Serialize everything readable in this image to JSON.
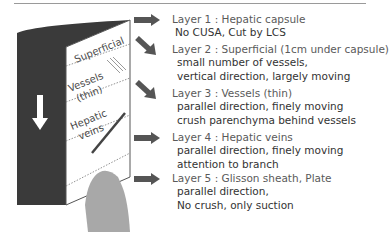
{
  "diagram": {
    "block_labels": [
      "Superficial",
      "Vessels",
      "(thin)",
      "Hepatic",
      "veins"
    ],
    "colors": {
      "dark_face": "#3a3a3a",
      "arrow": "#555555",
      "gray_shape": "#a8a8a8",
      "title_text": "#5a5a5a"
    },
    "arrow_icon": "down-arrow"
  },
  "layers": [
    {
      "title": "Layer 1 : Hepatic capsule",
      "lines": [
        "No CUSA, Cut by LCS"
      ],
      "arrow": "right"
    },
    {
      "title": "Layer 2 : Superficial (1cm under capsule)",
      "lines": [
        "small number of vessels,",
        "vertical direction, largely moving"
      ],
      "arrow": "down-right"
    },
    {
      "title": "Layer 3 : Vessels (thin)",
      "lines": [
        "parallel direction, finely moving",
        "crush parenchyma behind vessels"
      ],
      "arrow": "down-right"
    },
    {
      "title": "Layer 4 : Hepatic veins",
      "lines": [
        "parallel direction, finely moving",
        "attention to branch"
      ],
      "arrow": "right"
    },
    {
      "title": "Layer 5 : Glisson sheath, Plate",
      "lines": [
        "parallel direction,",
        "No crush, only suction"
      ],
      "arrow": "right"
    }
  ]
}
